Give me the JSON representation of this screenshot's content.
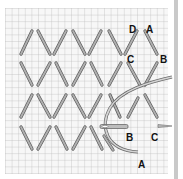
{
  "diagram": {
    "colors": {
      "grid": "#b9b9b9",
      "grid_bg": "#f7f7f7",
      "stitch_fill": "#a8a8a8",
      "stitch_edge": "#5a5a5a",
      "thread": "#9a9a9a",
      "label": "#111111",
      "edge_bar": "#c9c9c9"
    },
    "grid": {
      "x0": 5,
      "y0": 8,
      "x1": 168,
      "y1": 174,
      "cell": 6.6
    },
    "labels": {
      "top_d": "D",
      "top_a": "A",
      "top_c": "C",
      "top_b": "B",
      "bottom_b": "B",
      "bottom_c": "C",
      "bottom_a": "A"
    },
    "stitch_rows": 4,
    "needle": "needle-with-thread"
  }
}
